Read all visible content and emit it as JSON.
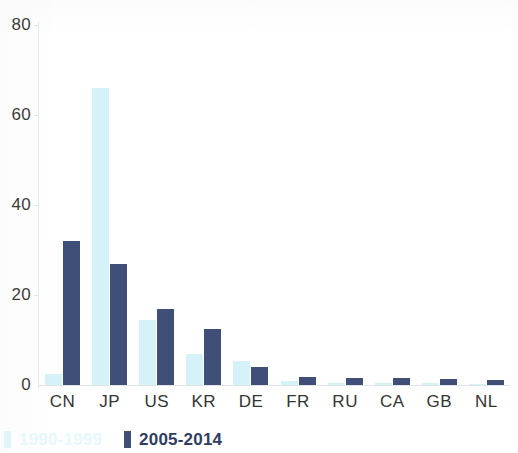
{
  "chart_data": {
    "type": "bar",
    "title": "",
    "subtitle": "",
    "xlabel": "",
    "ylabel": "",
    "ylim": [
      0,
      80
    ],
    "yticks": [
      0,
      20,
      40,
      60,
      80
    ],
    "ytick_labels": [
      "0",
      "20",
      "40",
      "60",
      "80"
    ],
    "grid": false,
    "legend_position": "bottom-left",
    "categories": [
      "CN",
      "JP",
      "US",
      "KR",
      "DE",
      "FR",
      "RU",
      "CA",
      "GB",
      "NL"
    ],
    "series": [
      {
        "name": "1990-1999",
        "color": "#d4f2f7",
        "values": [
          2.5,
          66,
          14.5,
          7,
          5.3,
          0.8,
          0.5,
          0.5,
          0.4,
          0.3
        ]
      },
      {
        "name": "2005-2014",
        "color": "#3f4f78",
        "values": [
          32,
          27,
          17,
          12.5,
          4,
          1.8,
          1.6,
          1.5,
          1.3,
          1.1
        ]
      }
    ]
  },
  "axis": {
    "y_tick_labels": [
      "80",
      "60",
      "40",
      "20",
      "0"
    ],
    "x_tick_labels": [
      "CN",
      "JP",
      "US",
      "KR",
      "DE",
      "FR",
      "RU",
      "CA",
      "GB",
      "NL"
    ]
  },
  "legend": {
    "entries": [
      {
        "label": "1990-1999",
        "color": "#d4f2f7"
      },
      {
        "label": "2005-2014",
        "color": "#3f4f78"
      }
    ]
  },
  "colors": {
    "series_a": "#d4f2f7",
    "series_b": "#3f4f78",
    "text": "#343434",
    "axis": "#e0e5e9",
    "background": "#ffffff"
  }
}
